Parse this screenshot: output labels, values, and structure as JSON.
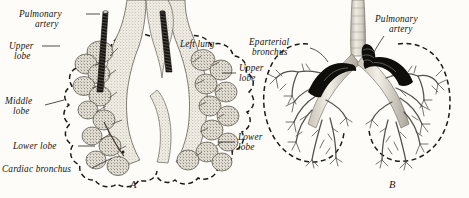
{
  "plate": {
    "kind": "anatomical-illustration",
    "subject": "Development of the bronchial tree and lungs",
    "background_color": "#fdfcf8",
    "ink_color": "#17140f"
  },
  "figures": [
    {
      "caption": "A",
      "description": "Early lobulated stage of the lungs with bronchial buds and pulmonary artery rods",
      "labels": [
        {
          "id": "pulmonary-artery",
          "text_line1": "Pulmonary",
          "text_line2": "artery"
        },
        {
          "id": "upper-lobe-left",
          "text_line1": "Upper",
          "text_line2": "lobe"
        },
        {
          "id": "middle-lobe",
          "text_line1": "Middle",
          "text_line2": "lobe"
        },
        {
          "id": "lower-lobe-left",
          "text_line1": "Lower lobe",
          "text_line2": ""
        },
        {
          "id": "cardiac-bronchus",
          "text_line1": "Cardiac bronchus",
          "text_line2": ""
        },
        {
          "id": "left-lung",
          "text_line1": "Left lung",
          "text_line2": ""
        },
        {
          "id": "upper-lobe-right",
          "text_line1": "Upper",
          "text_line2": "lobe"
        },
        {
          "id": "lower-lobe-right",
          "text_line1": "Lower",
          "text_line2": "lobe"
        }
      ]
    },
    {
      "caption": "B",
      "description": "Later stage showing the fully branched bronchial tree within the lung outlines",
      "labels": [
        {
          "id": "eparterial-bronchus",
          "text_line1": "Eparterial",
          "text_line2": "bronchus"
        },
        {
          "id": "pulmonary-artery-b",
          "text_line1": "Pulmonary",
          "text_line2": "artery"
        }
      ]
    }
  ],
  "colors": {
    "artery_dark": "#100e0b",
    "outline_dash": "#1d1a15",
    "tissue_stipple": "#6b655c",
    "paper": "#fdfcf8"
  }
}
